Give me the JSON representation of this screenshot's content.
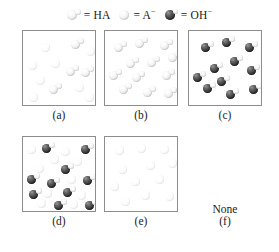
{
  "legend": {
    "entries": [
      {
        "icon": "ha-molecule-icon",
        "equals": "=",
        "label": "HA",
        "sup": ""
      },
      {
        "icon": "a-anion-icon",
        "equals": "=",
        "label": "A",
        "sup": "−"
      },
      {
        "icon": "oh-anion-icon",
        "equals": "=",
        "label": "OH",
        "sup": "−"
      }
    ]
  },
  "panels": [
    {
      "id": "a",
      "label": "(a)",
      "contents": "mixture of HA molecules and A− ions, all pale",
      "particles": [
        {
          "type": "HA",
          "x": 48,
          "y": 7,
          "faint": false
        },
        {
          "type": "A",
          "x": 18,
          "y": 12,
          "faint": true
        },
        {
          "type": "A",
          "x": 63,
          "y": 16,
          "faint": true
        },
        {
          "type": "A",
          "x": 5,
          "y": 30,
          "faint": true
        },
        {
          "type": "A",
          "x": 28,
          "y": 28,
          "faint": true
        },
        {
          "type": "HA",
          "x": 43,
          "y": 34,
          "faint": false
        },
        {
          "type": "HA",
          "x": 58,
          "y": 35,
          "faint": false
        },
        {
          "type": "A",
          "x": 13,
          "y": 45,
          "faint": true
        },
        {
          "type": "HA",
          "x": 26,
          "y": 52,
          "faint": false
        },
        {
          "type": "A",
          "x": 52,
          "y": 52,
          "faint": true
        },
        {
          "type": "A",
          "x": 6,
          "y": 62,
          "faint": true
        },
        {
          "type": "A",
          "x": 62,
          "y": 62,
          "faint": true
        }
      ]
    },
    {
      "id": "b",
      "label": "(b)",
      "contents": "HA molecules only, all pale",
      "particles": [
        {
          "type": "HA",
          "x": 9,
          "y": 10,
          "faint": false
        },
        {
          "type": "HA",
          "x": 30,
          "y": 6,
          "faint": false
        },
        {
          "type": "HA",
          "x": 55,
          "y": 8,
          "faint": false
        },
        {
          "type": "HA",
          "x": 63,
          "y": 20,
          "faint": false
        },
        {
          "type": "HA",
          "x": 21,
          "y": 26,
          "faint": false
        },
        {
          "type": "HA",
          "x": 42,
          "y": 25,
          "faint": false
        },
        {
          "type": "HA",
          "x": 4,
          "y": 38,
          "faint": false
        },
        {
          "type": "HA",
          "x": 27,
          "y": 40,
          "faint": false
        },
        {
          "type": "HA",
          "x": 57,
          "y": 38,
          "faint": false
        },
        {
          "type": "HA",
          "x": 14,
          "y": 52,
          "faint": false
        },
        {
          "type": "HA",
          "x": 38,
          "y": 55,
          "faint": false
        },
        {
          "type": "HA",
          "x": 59,
          "y": 56,
          "faint": false
        }
      ]
    },
    {
      "id": "c",
      "label": "(c)",
      "contents": "OH− ions only, dark spheres",
      "particles": [
        {
          "type": "OH",
          "x": 12,
          "y": 10,
          "faint": false
        },
        {
          "type": "OH",
          "x": 33,
          "y": 5,
          "faint": false
        },
        {
          "type": "OH",
          "x": 56,
          "y": 10,
          "faint": false
        },
        {
          "type": "OH",
          "x": 41,
          "y": 24,
          "faint": false
        },
        {
          "type": "OH",
          "x": 21,
          "y": 31,
          "faint": false
        },
        {
          "type": "OH",
          "x": 58,
          "y": 33,
          "faint": false
        },
        {
          "type": "OH",
          "x": 4,
          "y": 40,
          "faint": false
        },
        {
          "type": "OH",
          "x": 14,
          "y": 51,
          "faint": false
        },
        {
          "type": "OH",
          "x": 37,
          "y": 57,
          "faint": false
        },
        {
          "type": "OH",
          "x": 60,
          "y": 52,
          "faint": false
        },
        {
          "type": "OH",
          "x": 28,
          "y": 44,
          "faint": false
        }
      ]
    },
    {
      "id": "d",
      "label": "(d)",
      "contents": "mixture of OH− ions and pale A− / HA particles",
      "particles": [
        {
          "type": "A",
          "x": 4,
          "y": 8,
          "faint": true
        },
        {
          "type": "OH",
          "x": 19,
          "y": 5,
          "faint": false
        },
        {
          "type": "A",
          "x": 38,
          "y": 10,
          "faint": true
        },
        {
          "type": "OH",
          "x": 58,
          "y": 6,
          "faint": false
        },
        {
          "type": "A",
          "x": 27,
          "y": 18,
          "faint": true
        },
        {
          "type": "A",
          "x": 50,
          "y": 20,
          "faint": true
        },
        {
          "type": "OH",
          "x": 38,
          "y": 26,
          "faint": false
        },
        {
          "type": "A",
          "x": 12,
          "y": 27,
          "faint": true
        },
        {
          "type": "OH",
          "x": 4,
          "y": 36,
          "faint": false
        },
        {
          "type": "OH",
          "x": 24,
          "y": 40,
          "faint": false
        },
        {
          "type": "A",
          "x": 44,
          "y": 38,
          "faint": true
        },
        {
          "type": "OH",
          "x": 60,
          "y": 37,
          "faint": false
        },
        {
          "type": "OH",
          "x": 6,
          "y": 51,
          "faint": false
        },
        {
          "type": "A",
          "x": 20,
          "y": 52,
          "faint": true
        },
        {
          "type": "OH",
          "x": 40,
          "y": 49,
          "faint": false
        },
        {
          "type": "A",
          "x": 54,
          "y": 54,
          "faint": true
        },
        {
          "type": "A",
          "x": 14,
          "y": 62,
          "faint": true
        },
        {
          "type": "OH",
          "x": 31,
          "y": 62,
          "faint": false
        },
        {
          "type": "A",
          "x": 46,
          "y": 63,
          "faint": true
        },
        {
          "type": "OH",
          "x": 62,
          "y": 62,
          "faint": false
        }
      ]
    },
    {
      "id": "e",
      "label": "(e)",
      "contents": "A− ions only, very pale spheres",
      "particles": [
        {
          "type": "A",
          "x": 10,
          "y": 9,
          "faint": true
        },
        {
          "type": "A",
          "x": 32,
          "y": 7,
          "faint": true
        },
        {
          "type": "A",
          "x": 55,
          "y": 8,
          "faint": true
        },
        {
          "type": "A",
          "x": 63,
          "y": 22,
          "faint": true
        },
        {
          "type": "A",
          "x": 41,
          "y": 24,
          "faint": true
        },
        {
          "type": "A",
          "x": 13,
          "y": 28,
          "faint": true
        },
        {
          "type": "A",
          "x": 26,
          "y": 40,
          "faint": true
        },
        {
          "type": "A",
          "x": 50,
          "y": 38,
          "faint": true
        },
        {
          "type": "A",
          "x": 5,
          "y": 45,
          "faint": true
        },
        {
          "type": "A",
          "x": 36,
          "y": 54,
          "faint": true
        },
        {
          "type": "A",
          "x": 60,
          "y": 55,
          "faint": true
        },
        {
          "type": "A",
          "x": 16,
          "y": 60,
          "faint": true
        }
      ]
    },
    {
      "id": "f",
      "label": "(f)",
      "contents": "None",
      "none_text": "None",
      "particles": []
    }
  ]
}
